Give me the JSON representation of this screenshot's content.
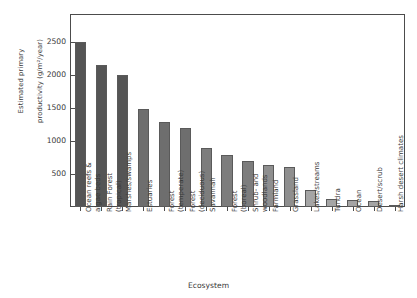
{
  "chart_data": {
    "type": "bar",
    "title": "",
    "xlabel": "Ecosystem",
    "ylabel": "Estimated primary\nproductivity (g/m²/year)",
    "ylabel_line1": "Estimated primary",
    "ylabel_line2": "productivity (g/m²/year)",
    "ylim": [
      0,
      2920
    ],
    "ytick_values": [
      500,
      1000,
      1500,
      2000,
      2500
    ],
    "ytick_labels": [
      "500",
      "1000",
      "1500",
      "2000",
      "2500"
    ],
    "grid": false,
    "legend": "none",
    "categories": [
      "Ocean reefs &\nalgae beds",
      "Rain Forest\n(tropical)",
      "Marshes/swamps",
      "Estuaries",
      "Forest\n(temperate)",
      "Forest\n(deciduous)",
      "Savannah",
      "Forest\n(boreal)",
      "Shrub- and\nwoodlands",
      "Farmland",
      "Grassland",
      "Lakes/streams",
      "Tundra",
      "Ocean",
      "Desert/scrub",
      "Harsh desert climates"
    ],
    "values": [
      2500,
      2150,
      1990,
      1480,
      1280,
      1200,
      890,
      790,
      690,
      630,
      610,
      250,
      125,
      100,
      95,
      30
    ],
    "bar_colors": [
      "#555555",
      "#555555",
      "#555555",
      "#6e6e6e",
      "#6e6e6e",
      "#6e6e6e",
      "#7d7d7d",
      "#7d7d7d",
      "#7d7d7d",
      "#8f8f8f",
      "#8f8f8f",
      "#a5a5a5",
      "#a5a5a5",
      "#a5a5a5",
      "#a5a5a5",
      "#a5a5a5"
    ],
    "axis_color": "#4c4c4c",
    "text_color": "#3a3a3a"
  }
}
